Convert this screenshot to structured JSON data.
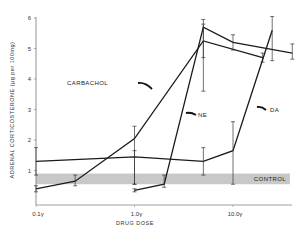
{
  "chart_data": {
    "type": "line",
    "title": "",
    "xlabel": "DRUG DOSE",
    "ylabel": "ADRENAL CORTICOSTERONE (µg per 100mg)",
    "x_scale": "log",
    "x_tick_labels": [
      "0.1γ",
      "1.0γ",
      "10.0γ"
    ],
    "x_tick_values": [
      0.1,
      1.0,
      10.0
    ],
    "y_tick_labels": [
      "1",
      "2",
      "3",
      "4",
      "5",
      "6"
    ],
    "ylim": [
      0,
      6
    ],
    "grid": false,
    "legend": "inline labels with arrows",
    "control_band": {
      "label": "CONTROL",
      "low": 0.55,
      "high": 0.9,
      "color": "#c8c8c8"
    },
    "series": [
      {
        "name": "CARBACHOL",
        "x": [
          0.1,
          0.25,
          1.0,
          5.0,
          20.0
        ],
        "values": [
          0.4,
          0.65,
          2.05,
          5.25,
          4.7
        ],
        "error": [
          [
            0.3,
            0.5
          ],
          [
            0.5,
            0.85
          ],
          [
            0.55,
            2.45
          ],
          [
            4.7,
            5.8
          ],
          [
            4.55,
            4.85
          ]
        ]
      },
      {
        "name": "NE",
        "x": [
          1.0,
          2.0,
          5.0,
          10.0,
          40.0
        ],
        "values": [
          0.35,
          0.55,
          5.7,
          5.2,
          4.85
        ],
        "error": [
          [
            0.3,
            0.4
          ],
          [
            0.45,
            0.85
          ],
          [
            3.6,
            5.95
          ],
          [
            4.95,
            5.45
          ],
          [
            4.65,
            5.15
          ]
        ]
      },
      {
        "name": "DA",
        "x": [
          0.1,
          1.0,
          5.0,
          10.0,
          25.0
        ],
        "values": [
          1.3,
          1.45,
          1.3,
          1.65,
          5.6
        ],
        "error": [
          [
            0.85,
            1.75
          ],
          [
            0.55,
            1.65
          ],
          [
            0.85,
            1.75
          ],
          [
            0.55,
            2.6
          ],
          [
            4.6,
            6.05
          ]
        ]
      }
    ]
  }
}
